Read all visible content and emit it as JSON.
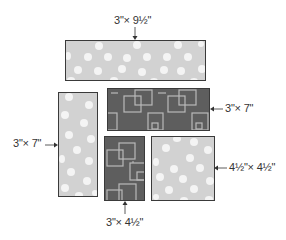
{
  "diagram": {
    "colors": {
      "light_fabric": "#d2d2d2",
      "dot": "#f4f4f4",
      "dark_fabric": "#5e5e5e",
      "square_outline": "#b9b9b9",
      "border": "#3a3a3a",
      "text": "#333333"
    },
    "pieces": [
      {
        "id": "strip-top",
        "pattern": "white dots on light gray",
        "label": "3\"× 9½\"",
        "arrow": "down"
      },
      {
        "id": "strip-dark",
        "pattern": "outlined squares on dark gray",
        "label": "3\"× 7\"",
        "arrow": "left"
      },
      {
        "id": "strip-left",
        "pattern": "white dots on light gray",
        "label": "3\"× 7\"",
        "arrow": "right"
      },
      {
        "id": "small-dark",
        "pattern": "outlined squares on dark gray",
        "label": "3\"× 4½\"",
        "arrow": "up"
      },
      {
        "id": "square",
        "pattern": "white dots on light gray",
        "label": "4½\"× 4½\"",
        "arrow": "left"
      }
    ]
  }
}
